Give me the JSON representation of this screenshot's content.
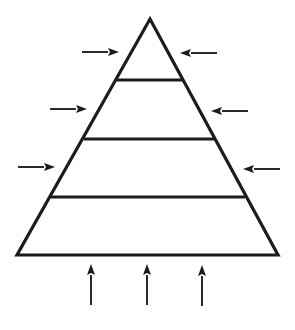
{
  "diagram": {
    "type": "pyramid",
    "tiers": 4,
    "colors": {
      "stroke": "#1c1c1c",
      "fill": "#ffffff",
      "background": "#ffffff"
    },
    "pyramid": {
      "apex": [
        150,
        19
      ],
      "base_left": [
        17,
        255
      ],
      "base_right": [
        278,
        255
      ],
      "divider_lines": [
        {
          "y": 80,
          "x1": 117,
          "x2": 183
        },
        {
          "y": 139,
          "x1": 84,
          "x2": 214
        },
        {
          "y": 197,
          "x1": 51,
          "x2": 245
        }
      ]
    },
    "arrows": {
      "left_inward": [
        {
          "x1": 82,
          "x2": 119,
          "y": 52,
          "direction": "right"
        },
        {
          "x1": 50,
          "x2": 87,
          "y": 109,
          "direction": "right"
        },
        {
          "x1": 18,
          "x2": 55,
          "y": 167,
          "direction": "right"
        }
      ],
      "right_inward": [
        {
          "x1": 217,
          "x2": 180,
          "y": 53,
          "direction": "left"
        },
        {
          "x1": 248,
          "x2": 211,
          "y": 111,
          "direction": "left"
        },
        {
          "x1": 280,
          "x2": 243,
          "y": 169,
          "direction": "left"
        }
      ],
      "bottom_upward": [
        {
          "x": 91,
          "y1": 305,
          "y2": 264,
          "direction": "up"
        },
        {
          "x": 147,
          "y1": 305,
          "y2": 264,
          "direction": "up"
        },
        {
          "x": 202,
          "y1": 306,
          "y2": 265,
          "direction": "up"
        }
      ]
    },
    "labels": []
  }
}
